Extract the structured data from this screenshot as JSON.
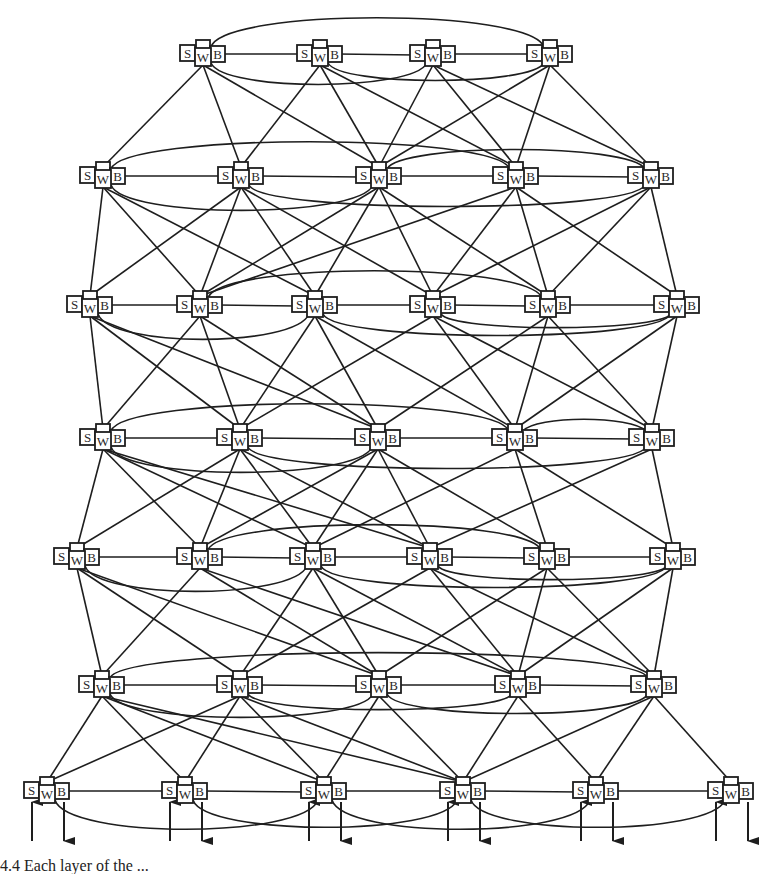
{
  "diagram": {
    "colors": {
      "line": "#1e1e1e",
      "box_fill": "#ffffff",
      "box_stroke": "#1e1e1e",
      "text": "#2a2a2a",
      "background": "#ffffff"
    },
    "node_labels": {
      "switch": "S",
      "worker": "W",
      "buffer": "B"
    },
    "rows": [
      {
        "y": 57,
        "x": [
          203,
          320,
          433,
          550
        ]
      },
      {
        "y": 179,
        "x": [
          103,
          241,
          379,
          516,
          651
        ]
      },
      {
        "y": 308,
        "x": [
          90,
          200,
          315,
          433,
          548,
          677
        ]
      },
      {
        "y": 441,
        "x": [
          103,
          240,
          378,
          515,
          652
        ]
      },
      {
        "y": 560,
        "x": [
          77,
          200,
          313,
          430,
          547,
          673
        ]
      },
      {
        "y": 688,
        "x": [
          102,
          240,
          379,
          518,
          654
        ]
      },
      {
        "y": 794,
        "x": [
          47,
          185,
          324,
          463,
          596,
          731
        ]
      }
    ],
    "down_edges": [
      [
        [
          0,
          0
        ],
        [
          0,
          1
        ],
        [
          0,
          2
        ],
        [
          1,
          1
        ],
        [
          1,
          2
        ],
        [
          1,
          3
        ],
        [
          2,
          2
        ],
        [
          2,
          3
        ],
        [
          2,
          4
        ],
        [
          3,
          2
        ],
        [
          3,
          3
        ],
        [
          3,
          4
        ]
      ],
      [
        [
          0,
          0
        ],
        [
          0,
          1
        ],
        [
          0,
          2
        ],
        [
          1,
          0
        ],
        [
          1,
          2
        ],
        [
          1,
          3
        ],
        [
          2,
          1
        ],
        [
          2,
          2
        ],
        [
          2,
          4
        ],
        [
          3,
          1
        ],
        [
          3,
          3
        ],
        [
          3,
          4
        ],
        [
          3,
          5
        ],
        [
          4,
          3
        ],
        [
          4,
          4
        ],
        [
          4,
          5
        ],
        [
          2,
          3
        ],
        [
          1,
          1
        ]
      ],
      [
        [
          0,
          0
        ],
        [
          0,
          1
        ],
        [
          0,
          2
        ],
        [
          1,
          0
        ],
        [
          1,
          2
        ],
        [
          2,
          1
        ],
        [
          2,
          2
        ],
        [
          2,
          3
        ],
        [
          3,
          1
        ],
        [
          3,
          3
        ],
        [
          3,
          4
        ],
        [
          4,
          2
        ],
        [
          4,
          3
        ],
        [
          4,
          4
        ],
        [
          5,
          3
        ],
        [
          5,
          4
        ],
        [
          1,
          1
        ]
      ],
      [
        [
          0,
          0
        ],
        [
          0,
          1
        ],
        [
          0,
          2
        ],
        [
          1,
          0
        ],
        [
          1,
          2
        ],
        [
          1,
          3
        ],
        [
          2,
          1
        ],
        [
          2,
          2
        ],
        [
          2,
          3
        ],
        [
          2,
          4
        ],
        [
          3,
          2
        ],
        [
          3,
          4
        ],
        [
          3,
          5
        ],
        [
          4,
          3
        ],
        [
          4,
          5
        ],
        [
          1,
          1
        ],
        [
          0,
          3
        ]
      ],
      [
        [
          0,
          0
        ],
        [
          0,
          1
        ],
        [
          0,
          2
        ],
        [
          1,
          0
        ],
        [
          1,
          2
        ],
        [
          2,
          1
        ],
        [
          2,
          2
        ],
        [
          2,
          3
        ],
        [
          3,
          1
        ],
        [
          3,
          3
        ],
        [
          3,
          4
        ],
        [
          4,
          2
        ],
        [
          4,
          3
        ],
        [
          4,
          4
        ],
        [
          5,
          3
        ],
        [
          5,
          4
        ],
        [
          1,
          3
        ]
      ],
      [
        [
          0,
          0
        ],
        [
          0,
          1
        ],
        [
          0,
          2
        ],
        [
          1,
          0
        ],
        [
          1,
          1
        ],
        [
          1,
          2
        ],
        [
          1,
          3
        ],
        [
          2,
          2
        ],
        [
          2,
          3
        ],
        [
          3,
          3
        ],
        [
          3,
          4
        ],
        [
          4,
          3
        ],
        [
          4,
          4
        ],
        [
          4,
          5
        ],
        [
          0,
          3
        ]
      ]
    ],
    "rings": [
      {
        "row": 0,
        "arcs": [
          {
            "from": 0,
            "to": 3,
            "side": "top",
            "h": 30
          },
          {
            "from": 0,
            "to": 2,
            "side": "bottom",
            "h": 22
          },
          {
            "from": 1,
            "to": 3,
            "side": "bottom",
            "h": 18
          }
        ]
      },
      {
        "row": 1,
        "arcs": [
          {
            "from": 0,
            "to": 3,
            "side": "top",
            "h": 28
          },
          {
            "from": 2,
            "to": 4,
            "side": "top",
            "h": 20
          },
          {
            "from": 0,
            "to": 2,
            "side": "bottom",
            "h": 26
          },
          {
            "from": 1,
            "to": 4,
            "side": "bottom",
            "h": 22
          }
        ]
      },
      {
        "row": 2,
        "arcs": [
          {
            "from": 1,
            "to": 4,
            "side": "top",
            "h": 28
          },
          {
            "from": 0,
            "to": 2,
            "side": "bottom",
            "h": 26
          },
          {
            "from": 2,
            "to": 5,
            "side": "bottom",
            "h": 22
          },
          {
            "from": 3,
            "to": 5,
            "side": "bottom",
            "h": 14
          }
        ]
      },
      {
        "row": 3,
        "arcs": [
          {
            "from": 0,
            "to": 3,
            "side": "top",
            "h": 28
          },
          {
            "from": 3,
            "to": 4,
            "side": "top",
            "h": 12
          },
          {
            "from": 0,
            "to": 2,
            "side": "bottom",
            "h": 26
          },
          {
            "from": 1,
            "to": 4,
            "side": "bottom",
            "h": 22
          }
        ]
      },
      {
        "row": 4,
        "arcs": [
          {
            "from": 1,
            "to": 4,
            "side": "top",
            "h": 26
          },
          {
            "from": 0,
            "to": 2,
            "side": "bottom",
            "h": 26
          },
          {
            "from": 2,
            "to": 5,
            "side": "bottom",
            "h": 22
          },
          {
            "from": 3,
            "to": 5,
            "side": "bottom",
            "h": 14
          }
        ]
      },
      {
        "row": 5,
        "arcs": [
          {
            "from": 0,
            "to": 4,
            "side": "top",
            "h": 26
          },
          {
            "from": 0,
            "to": 2,
            "side": "bottom",
            "h": 24
          },
          {
            "from": 2,
            "to": 4,
            "side": "bottom",
            "h": 20
          },
          {
            "from": 1,
            "to": 3,
            "side": "bottom",
            "h": 16
          }
        ]
      },
      {
        "row": 6,
        "arcs": [
          {
            "from": 0,
            "to": 2,
            "side": "bottom",
            "h": 30
          },
          {
            "from": 1,
            "to": 3,
            "side": "bottom",
            "h": 28
          },
          {
            "from": 2,
            "to": 4,
            "side": "bottom",
            "h": 30
          },
          {
            "from": 3,
            "to": 5,
            "side": "bottom",
            "h": 28
          }
        ]
      }
    ],
    "io_arrows": {
      "row": 6,
      "in_offset_x": -15,
      "out_offset_x": 17,
      "length": 42
    },
    "caption_fragment": "4.4  Each layer of the ..."
  }
}
